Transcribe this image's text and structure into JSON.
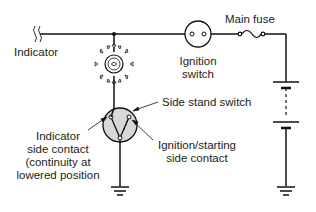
{
  "diagram": {
    "labels": {
      "indicator": "Indicator",
      "main_fuse": "Main fuse",
      "ignition_switch_line1": "Ignition",
      "ignition_switch_line2": "switch",
      "side_stand_switch": "Side stand switch",
      "indicator_contact_line1": "Indicator",
      "indicator_contact_line2": "side contact",
      "indicator_contact_line3": "(continuity at",
      "indicator_contact_line4": "lowered position",
      "ignition_contact_line1": "Ignition/starting",
      "ignition_contact_line2": "side contact"
    },
    "components": [
      "indicator lamp",
      "ignition switch",
      "main fuse",
      "battery",
      "side stand switch",
      "ground (x2)"
    ],
    "colors": {
      "line": "#111111",
      "switch_fill": "#d8d8d8"
    }
  }
}
